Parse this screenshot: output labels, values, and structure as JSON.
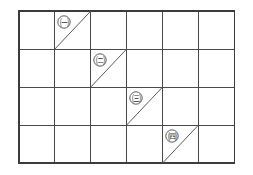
{
  "figure": {
    "background_color": "#ffffff",
    "line_color": "#4a4a4a",
    "diagonal_color": "#5a5a5a",
    "label_text_color": "#2e2e2e"
  },
  "grid": {
    "columns": 6,
    "rows": 4,
    "origin_x": 19,
    "origin_y": 11,
    "cell_width": 35.9,
    "cell_height": 38.0,
    "column_x": [
      19,
      54.9,
      90.8,
      126.7,
      162.6,
      198.5,
      234.4
    ],
    "row_y": [
      11,
      49,
      87,
      125,
      163
    ]
  },
  "diagonals": [
    {
      "id": "diagonal-1",
      "label": "㈠",
      "label_name": "circled-giyeok",
      "column": 2,
      "row": 1,
      "from": "bottom-left",
      "to": "top-right",
      "label_x": 64,
      "label_y": 22
    },
    {
      "id": "diagonal-2",
      "label": "㈡",
      "label_name": "circled-nieun",
      "column": 3,
      "row": 2,
      "from": "bottom-left",
      "to": "top-right",
      "label_x": 100,
      "label_y": 60
    },
    {
      "id": "diagonal-3",
      "label": "㈢",
      "label_name": "circled-digeut",
      "column": 4,
      "row": 3,
      "from": "bottom-left",
      "to": "top-right",
      "label_x": 136,
      "label_y": 98
    },
    {
      "id": "diagonal-4",
      "label": "㈣",
      "label_name": "circled-rieul",
      "column": 5,
      "row": 4,
      "from": "bottom-left",
      "to": "top-right",
      "label_x": 172,
      "label_y": 136
    }
  ]
}
